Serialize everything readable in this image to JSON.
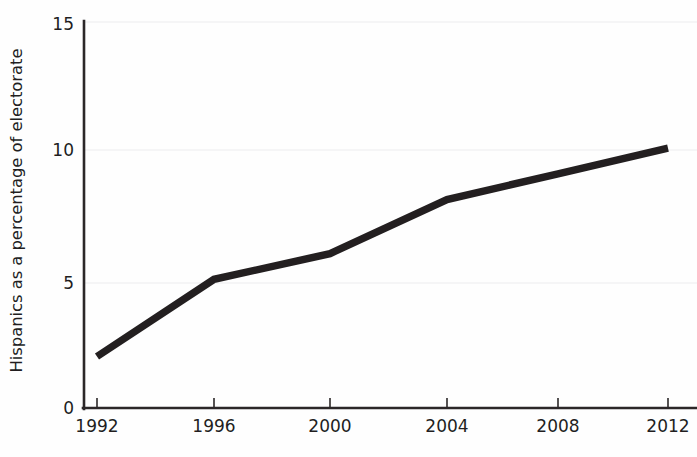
{
  "chart_data": {
    "type": "line",
    "title": "",
    "subtitle": "",
    "xlabel": "",
    "ylabel": "Hispanics as a percentage of electorate",
    "x": [
      1992,
      1996,
      2000,
      2004,
      2008,
      2012
    ],
    "categories": [
      "1992",
      "1996",
      "2000",
      "2004",
      "2008",
      "2012"
    ],
    "series": [
      {
        "name": "Hispanics as a percentage of electorate",
        "values": [
          2.0,
          5.0,
          6.0,
          8.1,
          9.1,
          10.1
        ],
        "color": "#231f20"
      }
    ],
    "xlim": [
      1992,
      2012
    ],
    "ylim": [
      0,
      15
    ],
    "ytick_values": [
      0,
      5,
      10,
      15
    ],
    "ytick_labels": [
      "0",
      "5",
      "10",
      "15"
    ],
    "xtick_labels": [
      "1992",
      "1996",
      "2000",
      "2004",
      "2008",
      "2012"
    ],
    "grid": "horizontal",
    "gridline_values": [
      5,
      10,
      15
    ],
    "legend": "none",
    "annotations": [],
    "colors": {
      "line": "#231f20",
      "axis": "#2b2728",
      "grid": "#ececed",
      "text": "#221e1f",
      "background": "#ffffff"
    }
  },
  "axes": {
    "y_title": "Hispanics as a percentage of electorate",
    "y_ticks": [
      {
        "label": "15",
        "value": 15
      },
      {
        "label": "10",
        "value": 10
      },
      {
        "label": "5",
        "value": 5
      },
      {
        "label": "0",
        "value": 0
      }
    ],
    "x_ticks": [
      {
        "label": "1992",
        "value": 1992
      },
      {
        "label": "1996",
        "value": 1996
      },
      {
        "label": "2000",
        "value": 2000
      },
      {
        "label": "2004",
        "value": 2004
      },
      {
        "label": "2008",
        "value": 2008
      },
      {
        "label": "2012",
        "value": 2012
      }
    ]
  }
}
